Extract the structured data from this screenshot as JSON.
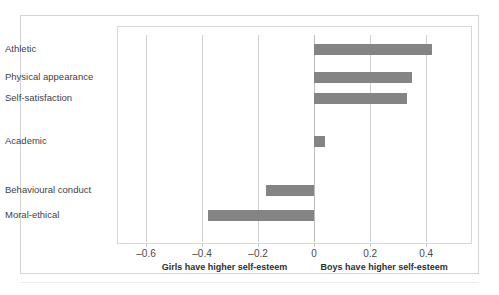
{
  "chart_data": {
    "type": "bar",
    "orientation": "horizontal",
    "title": "",
    "subtitle": "",
    "xlabel": "",
    "ylabel": "",
    "xlim": [
      -0.7,
      0.56
    ],
    "xticks": [
      -0.6,
      -0.4,
      -0.2,
      0,
      0.2,
      0.4
    ],
    "xtick_labels": [
      "–0.6",
      "–0.4",
      "–0.2",
      "0",
      "0.2",
      "0.4"
    ],
    "grid": "vertical",
    "legend": "none",
    "bar_color": "#848484",
    "categories": [
      "Athletic",
      "Physical appearance",
      "Self-satisfaction",
      "Academic",
      "Behavioural conduct",
      "Moral-ethical"
    ],
    "values": [
      0.42,
      0.35,
      0.33,
      0.04,
      -0.17,
      -0.38
    ],
    "annotations": [
      {
        "text": "Girls have higher self-esteem",
        "x": -0.32,
        "position": "below-axis"
      },
      {
        "text": "Boys have higher self-esteem",
        "x": 0.25,
        "position": "below-axis"
      }
    ],
    "caption_ghost": ""
  },
  "footnotes": {
    "left": "Girls have higher self-esteem",
    "right": "Boys have higher self-esteem"
  }
}
